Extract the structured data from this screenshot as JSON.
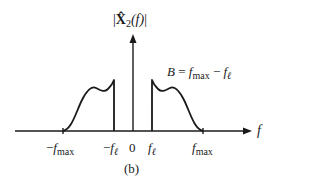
{
  "figure": {
    "y_axis_label": {
      "prefix": "|",
      "symbol": "X̂",
      "subscript": "2",
      "arg": "(f)",
      "suffix": "|"
    },
    "x_axis_label": "f",
    "bandwidth_annotation": {
      "lhs": "B",
      "eq": " = ",
      "f1": "f",
      "f1_sub": "max",
      "minus": " − ",
      "f2": "f",
      "f2_sub": "ℓ"
    },
    "ticks": [
      {
        "sign": "−",
        "f": "f",
        "sub": "max"
      },
      {
        "sign": "−",
        "f": "f",
        "sub": "ℓ"
      },
      {
        "sign": "",
        "f": "0",
        "sub": ""
      },
      {
        "sign": "",
        "f": "f",
        "sub": "ℓ"
      },
      {
        "sign": "",
        "f": "f",
        "sub": "max"
      }
    ],
    "caption": "(b)"
  },
  "colors": {
    "ink": "#1a1a1a",
    "background": "#ffffff"
  }
}
